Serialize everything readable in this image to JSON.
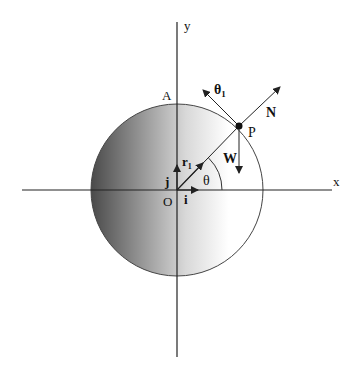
{
  "diagram": {
    "type": "vector-diagram",
    "labels": {
      "x_axis": "x",
      "y_axis": "y",
      "origin": "O",
      "point_a": "A",
      "point_p": "P",
      "normal": "N",
      "weight": "W",
      "theta1": "θ",
      "theta1_sub": "1",
      "r1": "r",
      "r1_sub": "1",
      "theta": "θ",
      "unit_i": "i",
      "unit_j": "j"
    },
    "colors": {
      "line": "#222222",
      "shade_dark": "#4a4a4a",
      "shade_light": "#ffffff"
    }
  }
}
